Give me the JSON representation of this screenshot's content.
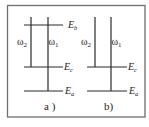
{
  "colors": {
    "line": "#2a2a2a",
    "border": "#6e6e6e",
    "text": "#222222",
    "background": "#ffffff"
  },
  "panels": [
    {
      "id": "a",
      "caption": "a )",
      "levels": [
        {
          "name": "E",
          "sub": "b",
          "y": 25
        },
        {
          "name": "E",
          "sub": "c",
          "y": 67
        },
        {
          "name": "E",
          "sub": "a",
          "y": 91
        }
      ],
      "transitions": [
        {
          "label": "ω",
          "sub": "2",
          "from": "top",
          "to": "Ec"
        },
        {
          "label": "ω",
          "sub": "1",
          "from": "top",
          "to": "Ea"
        }
      ]
    },
    {
      "id": "b",
      "caption": "b)",
      "levels": [
        {
          "name": "E",
          "sub": "c",
          "y": 67
        },
        {
          "name": "E",
          "sub": "a",
          "y": 91
        }
      ],
      "transitions": [
        {
          "label": "ω",
          "sub": "2",
          "from": "top",
          "to": "Ec"
        },
        {
          "label": "ω",
          "sub": "1",
          "from": "top",
          "to": "Ea"
        }
      ]
    }
  ]
}
